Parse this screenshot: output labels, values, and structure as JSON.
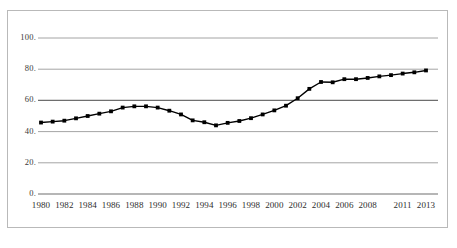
{
  "chart_data": {
    "type": "line",
    "title": "",
    "subtitle": "",
    "xlabel": "",
    "ylabel": "",
    "xlim": [
      1980,
      2013
    ],
    "ylim": [
      0,
      100
    ],
    "grid": true,
    "legend": false,
    "legend_position": "none",
    "marker": "square",
    "line_color": "#000000",
    "marker_color": "#000000",
    "grid_color": "#808080",
    "axis_color": "#808080",
    "ytick_labels": [
      "100.",
      "80.",
      "60.",
      "40.",
      "20.",
      "0."
    ],
    "ytick_values": [
      100,
      80,
      60,
      40,
      20,
      0
    ],
    "xtick_labels": [
      "1980",
      "1982",
      "1984",
      "1986",
      "1988",
      "1990",
      "1992",
      "1994",
      "1996",
      "1998",
      "2000",
      "2002",
      "2004",
      "2006",
      "2008",
      "2011",
      "2013"
    ],
    "xtick_values": [
      1980,
      1982,
      1984,
      1986,
      1988,
      1990,
      1992,
      1994,
      1996,
      1998,
      2000,
      2002,
      2004,
      2006,
      2008,
      2011,
      2013
    ],
    "x": [
      1980,
      1981,
      1982,
      1983,
      1984,
      1985,
      1986,
      1987,
      1988,
      1989,
      1990,
      1991,
      1992,
      1993,
      1994,
      1995,
      1996,
      1997,
      1998,
      1999,
      2000,
      2001,
      2002,
      2003,
      2004,
      2005,
      2006,
      2007,
      2008,
      2009,
      2010,
      2011,
      2012,
      2013
    ],
    "values": [
      45.8,
      46.4,
      47.0,
      48.5,
      50.0,
      51.5,
      53.0,
      55.4,
      56.2,
      56.2,
      55.4,
      53.4,
      51.0,
      47.2,
      46.0,
      44.0,
      45.6,
      46.8,
      48.6,
      51.0,
      53.6,
      56.6,
      61.4,
      67.4,
      71.8,
      71.6,
      73.6,
      73.6,
      74.4,
      75.4,
      76.2,
      77.2,
      78.0,
      79.2
    ],
    "series": [
      {
        "name": "series-1",
        "values": [
          45.8,
          46.4,
          47.0,
          48.5,
          50.0,
          51.5,
          53.0,
          55.4,
          56.2,
          56.2,
          55.4,
          53.4,
          51.0,
          47.2,
          46.0,
          44.0,
          45.6,
          46.8,
          48.6,
          51.0,
          53.6,
          56.6,
          61.4,
          67.4,
          71.8,
          71.6,
          73.6,
          73.6,
          74.4,
          75.4,
          76.2,
          77.2,
          78.0,
          79.2
        ]
      }
    ]
  },
  "layout": {
    "plot_left": 41,
    "plot_right": 426,
    "plot_top": 38,
    "plot_bottom": 194
  }
}
